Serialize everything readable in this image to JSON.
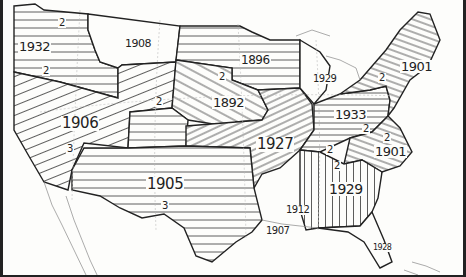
{
  "map": {
    "subject": "United States regions hatched by year",
    "regions": [
      {
        "id": "pacific-nw",
        "year": "1932",
        "sub_labels": [
          "2",
          "2"
        ],
        "hatch": "horizontal"
      },
      {
        "id": "montana",
        "year": "1908",
        "sub_labels": [],
        "hatch": "none"
      },
      {
        "id": "west",
        "year": "1906",
        "sub_labels": [
          "2",
          "3"
        ],
        "hatch": "diagonal-up"
      },
      {
        "id": "upper-midwest",
        "year": "1896",
        "sub_labels": [],
        "hatch": "horizontal"
      },
      {
        "id": "plains",
        "year": "1892",
        "sub_labels": [
          "2"
        ],
        "hatch": "diagonal-down"
      },
      {
        "id": "michigan",
        "year": "1929",
        "sub_labels": [],
        "hatch": "none"
      },
      {
        "id": "new-england",
        "year": "1901",
        "sub_labels": [
          "2"
        ],
        "hatch": "diagonal-up"
      },
      {
        "id": "mid-atlantic",
        "year": "1933",
        "sub_labels": [
          "2",
          "2"
        ],
        "hatch": "horizontal"
      },
      {
        "id": "central",
        "year": "1927",
        "sub_labels": [
          "2"
        ],
        "hatch": "diagonal-up"
      },
      {
        "id": "carolinas",
        "year": "1901",
        "sub_labels": [],
        "hatch": "diagonal-down"
      },
      {
        "id": "southeast",
        "year": "1929",
        "sub_labels": [
          "2"
        ],
        "hatch": "vertical"
      },
      {
        "id": "southwest",
        "year": "1905",
        "sub_labels": [
          "3"
        ],
        "hatch": "horizontal"
      },
      {
        "id": "arkansas-lower",
        "year": "1912",
        "sub_labels": [],
        "hatch": "none"
      },
      {
        "id": "louisiana",
        "year": "1907",
        "sub_labels": [],
        "hatch": "none"
      },
      {
        "id": "florida",
        "year": "1928",
        "sub_labels": [],
        "hatch": "none"
      }
    ]
  },
  "labels": {
    "pnw_year": "1932",
    "pnw_a": "2",
    "pnw_b": "2",
    "mt_year": "1908",
    "west_year": "1906",
    "west_a": "2",
    "west_b": "3",
    "um_year": "1896",
    "pl_year": "1892",
    "pl_a": "2",
    "mi_year": "1929",
    "ne_year": "1901",
    "ne_a": "2",
    "ma_year": "1933",
    "ma_a": "2",
    "ma_b": "2",
    "ce_year": "1927",
    "ce_a": "2",
    "nc_year": "1901",
    "se_year": "1929",
    "se_a": "2",
    "sw_year": "1905",
    "sw_a": "3",
    "ar_year": "1912",
    "la_year": "1907",
    "fl_year": "1928"
  }
}
